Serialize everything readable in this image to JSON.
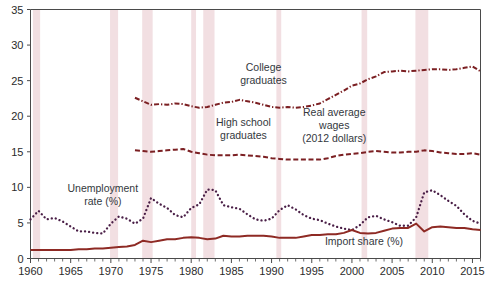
{
  "figure": {
    "background_color": "#ffffff",
    "plot_frame_color": "#4a4a4a"
  },
  "chart_data": {
    "type": "line",
    "title": "",
    "subtitle": "",
    "xlabel": "",
    "ylabel": "",
    "xlim": [
      1960,
      2016
    ],
    "ylim": [
      0,
      35
    ],
    "grid": false,
    "legend_position": "inline-annotations",
    "x_major_ticks": [
      1960,
      1965,
      1970,
      1975,
      1980,
      1985,
      1990,
      1995,
      2000,
      2005,
      2010,
      2015
    ],
    "x_major_tick_labels": [
      "1960",
      "1965",
      "1970",
      "1975",
      "1980",
      "1985",
      "1990",
      "1995",
      "2000",
      "2005",
      "2010",
      "2015"
    ],
    "x_minor_tick_step": 1,
    "y_ticks": [
      0,
      5,
      10,
      15,
      20,
      25,
      30,
      35
    ],
    "y_tick_labels": [
      "0",
      "5",
      "10",
      "15",
      "20",
      "25",
      "30",
      "35"
    ],
    "annotations": [
      {
        "name": "college-graduates-label",
        "text_lines": [
          "College",
          "graduates"
        ],
        "x": 1989.0,
        "y": 26.4
      },
      {
        "name": "high-school-graduates-label",
        "text_lines": [
          "High school",
          "graduates"
        ],
        "x": 1986.5,
        "y": 18.6
      },
      {
        "name": "real-average-wages-label",
        "text_lines": [
          "Real average",
          "wages",
          "(2012 dollars)"
        ],
        "x": 1997.8,
        "y": 20.1
      },
      {
        "name": "unemployment-rate-label",
        "text_lines": [
          "Unemployment",
          "rate (%)"
        ],
        "x": 1969.0,
        "y": 9.4
      },
      {
        "name": "import-share-label",
        "text_lines": [
          "Import share (%)"
        ],
        "x": 2001.5,
        "y": 1.9
      }
    ],
    "recession_bands": {
      "name": "recession-shading",
      "color": "#f2dfe2",
      "spans": [
        [
          1960.3,
          1961.2
        ],
        [
          1969.9,
          1970.9
        ],
        [
          1973.9,
          1975.2
        ],
        [
          1980.0,
          1980.6
        ],
        [
          1981.5,
          1982.9
        ],
        [
          1990.6,
          1991.2
        ],
        [
          2001.2,
          2001.9
        ],
        [
          2007.9,
          2009.5
        ]
      ]
    },
    "series": [
      {
        "name": "College graduates",
        "key": "college-graduates",
        "color": "#7b1f22",
        "style": "dash-dot",
        "units": "dollars per hour (2012 dollars)",
        "x": [
          1973,
          1974,
          1975,
          1976,
          1977,
          1978,
          1979,
          1980,
          1981,
          1982,
          1983,
          1984,
          1985,
          1986,
          1987,
          1988,
          1989,
          1990,
          1991,
          1992,
          1993,
          1994,
          1995,
          1996,
          1997,
          1998,
          1999,
          2000,
          2001,
          2002,
          2003,
          2004,
          2005,
          2006,
          2007,
          2008,
          2009,
          2010,
          2011,
          2012,
          2013,
          2014,
          2015,
          2016
        ],
        "values": [
          22.6,
          22.1,
          21.6,
          21.7,
          21.6,
          21.8,
          21.7,
          21.4,
          21.2,
          21.3,
          21.6,
          21.9,
          22.0,
          22.3,
          22.1,
          21.9,
          21.6,
          21.3,
          21.2,
          21.3,
          21.2,
          21.3,
          21.5,
          21.8,
          22.4,
          23.0,
          23.6,
          24.3,
          24.6,
          25.2,
          25.6,
          26.2,
          26.3,
          26.4,
          26.3,
          26.4,
          26.5,
          26.6,
          26.6,
          26.5,
          26.6,
          26.8,
          27.0,
          26.3
        ]
      },
      {
        "name": "High school graduates",
        "key": "high-school-graduates",
        "color": "#7b1f22",
        "style": "dashed",
        "units": "dollars per hour (2012 dollars)",
        "x": [
          1973,
          1974,
          1975,
          1976,
          1977,
          1978,
          1979,
          1980,
          1981,
          1982,
          1983,
          1984,
          1985,
          1986,
          1987,
          1988,
          1989,
          1990,
          1991,
          1992,
          1993,
          1994,
          1995,
          1996,
          1997,
          1998,
          1999,
          2000,
          2001,
          2002,
          2003,
          2004,
          2005,
          2006,
          2007,
          2008,
          2009,
          2010,
          2011,
          2012,
          2013,
          2014,
          2015,
          2016
        ],
        "values": [
          15.2,
          15.1,
          15.0,
          15.1,
          15.2,
          15.3,
          15.4,
          15.0,
          14.8,
          14.6,
          14.5,
          14.5,
          14.5,
          14.6,
          14.5,
          14.4,
          14.3,
          14.1,
          14.0,
          13.9,
          13.9,
          13.9,
          13.9,
          13.9,
          14.1,
          14.4,
          14.6,
          14.7,
          14.8,
          15.0,
          15.1,
          15.0,
          14.9,
          14.9,
          15.0,
          15.0,
          15.2,
          15.1,
          14.9,
          14.8,
          14.7,
          14.7,
          14.8,
          14.6
        ]
      },
      {
        "name": "Unemployment rate (%)",
        "key": "unemployment-rate",
        "color": "#4a1f47",
        "style": "dotted",
        "units": "percent",
        "x": [
          1960,
          1961,
          1962,
          1963,
          1964,
          1965,
          1966,
          1967,
          1968,
          1969,
          1970,
          1971,
          1972,
          1973,
          1974,
          1975,
          1976,
          1977,
          1978,
          1979,
          1980,
          1981,
          1982,
          1983,
          1984,
          1985,
          1986,
          1987,
          1988,
          1989,
          1990,
          1991,
          1992,
          1993,
          1994,
          1995,
          1996,
          1997,
          1998,
          1999,
          2000,
          2001,
          2002,
          2003,
          2004,
          2005,
          2006,
          2007,
          2008,
          2009,
          2010,
          2011,
          2012,
          2013,
          2014,
          2015,
          2016
        ],
        "values": [
          5.5,
          6.7,
          5.5,
          5.7,
          5.2,
          4.5,
          3.8,
          3.8,
          3.6,
          3.5,
          4.9,
          5.9,
          5.6,
          4.9,
          5.6,
          8.5,
          7.7,
          7.1,
          6.1,
          5.8,
          7.1,
          7.6,
          9.7,
          9.6,
          7.5,
          7.2,
          7.0,
          6.2,
          5.5,
          5.3,
          5.6,
          6.8,
          7.5,
          6.9,
          6.1,
          5.6,
          5.4,
          4.9,
          4.5,
          4.2,
          4.0,
          4.7,
          5.8,
          6.0,
          5.5,
          5.1,
          4.6,
          4.6,
          5.8,
          9.3,
          9.6,
          8.9,
          8.1,
          7.4,
          6.2,
          5.3,
          4.9
        ]
      },
      {
        "name": "Import share (%)",
        "key": "import-share",
        "color": "#8e2a24",
        "style": "solid",
        "units": "percent of GDP",
        "x": [
          1960,
          1961,
          1962,
          1963,
          1964,
          1965,
          1966,
          1967,
          1968,
          1969,
          1970,
          1971,
          1972,
          1973,
          1974,
          1975,
          1976,
          1977,
          1978,
          1979,
          1980,
          1981,
          1982,
          1983,
          1984,
          1985,
          1986,
          1987,
          1988,
          1989,
          1990,
          1991,
          1992,
          1993,
          1994,
          1995,
          1996,
          1997,
          1998,
          1999,
          2000,
          2001,
          2002,
          2003,
          2004,
          2005,
          2006,
          2007,
          2008,
          2009,
          2010,
          2011,
          2012,
          2013,
          2014,
          2015,
          2016
        ],
        "values": [
          1.2,
          1.2,
          1.2,
          1.2,
          1.2,
          1.2,
          1.3,
          1.3,
          1.4,
          1.4,
          1.5,
          1.6,
          1.7,
          1.9,
          2.5,
          2.3,
          2.5,
          2.7,
          2.7,
          2.9,
          3.0,
          2.9,
          2.7,
          2.8,
          3.2,
          3.1,
          3.1,
          3.2,
          3.2,
          3.2,
          3.1,
          2.9,
          2.9,
          2.9,
          3.1,
          3.3,
          3.3,
          3.4,
          3.4,
          3.6,
          4.0,
          3.6,
          3.5,
          3.6,
          3.9,
          4.2,
          4.3,
          4.3,
          4.9,
          3.8,
          4.4,
          4.5,
          4.4,
          4.3,
          4.3,
          4.1,
          4.0
        ]
      }
    ]
  }
}
